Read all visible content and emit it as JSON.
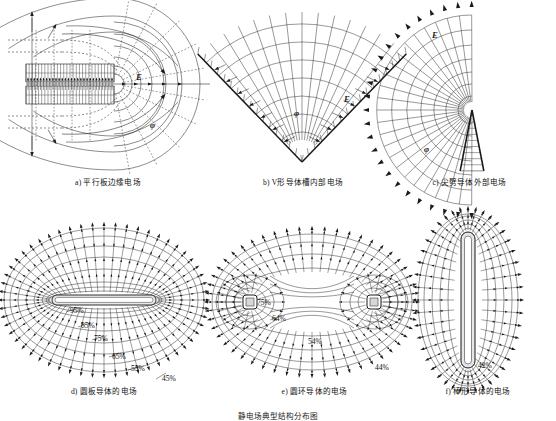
{
  "figure": {
    "title": "静电场典型结构分布图",
    "background": "#ffffff",
    "ink": "#1a1a1a",
    "panels": [
      {
        "id": "a",
        "caption": "a) 平行板边缘电场",
        "type": "parallel-plate-fringing",
        "labels": [
          {
            "text": "E",
            "x": 134,
            "y": 78,
            "kind": "field-strength"
          },
          {
            "text": "φ",
            "x": 146,
            "y": 122,
            "kind": "potential"
          }
        ],
        "geometry": {
          "plate_left": 24,
          "plate_right": 112,
          "plate_top": 60,
          "plate_bottom": 100,
          "axis_y": 80,
          "plate_rows": 2,
          "plate_hatch_count": 26,
          "equipotential_radii": [
            12,
            22,
            33,
            46,
            62,
            80
          ],
          "flux_angles": [
            0,
            20,
            40,
            60,
            80,
            100,
            120,
            140,
            160,
            180
          ]
        }
      },
      {
        "id": "b",
        "caption": "b) V形导体槽内部电场",
        "type": "v-groove-internal",
        "labels": [
          {
            "text": "E",
            "x": 118,
            "y": 92,
            "kind": "field-strength"
          },
          {
            "text": "φ",
            "x": 66,
            "y": 105,
            "kind": "potential"
          }
        ],
        "geometry": {
          "apex_x": 62,
          "apex_y": 158,
          "half_angle_deg": 42,
          "arc_radii": [
            28,
            45,
            62,
            79,
            96,
            113,
            130,
            147
          ],
          "ray_count": 13,
          "hatch_count": 12
        }
      },
      {
        "id": "c",
        "caption": "c) 尖劈导体外部电场",
        "type": "wedge-external",
        "labels": [
          {
            "text": "E",
            "x": 40,
            "y": 28,
            "kind": "field-strength"
          },
          {
            "text": "φ",
            "x": 36,
            "y": 140,
            "kind": "potential"
          }
        ],
        "geometry": {
          "apex_x": 78,
          "apex_y": 96,
          "wedge_half_angle_deg": 12,
          "arc_radii": [
            14,
            26,
            38,
            51,
            65,
            80,
            96
          ],
          "ray_count": 21,
          "arrow_ring_radius": 96
        }
      },
      {
        "id": "d",
        "caption": "d) 圆板导体的电场",
        "type": "disc-conductor",
        "labels": [
          {
            "text": "E",
            "x": 0,
            "y": 0,
            "kind": "none"
          }
        ],
        "percent_labels": [
          {
            "text": "95%",
            "x": 66,
            "y": 97
          },
          {
            "text": "85%",
            "x": 77,
            "y": 112
          },
          {
            "text": "75%",
            "x": 90,
            "y": 125
          },
          {
            "text": "65%",
            "x": 108,
            "y": 143
          },
          {
            "text": "55%",
            "x": 127,
            "y": 155
          },
          {
            "text": "45%",
            "x": 158,
            "y": 165
          }
        ],
        "geometry": {
          "cx": 102,
          "cy": 87,
          "plate_half_width": 52,
          "plate_half_height": 5,
          "shell_count": 7,
          "outer_rx": 95,
          "outer_ry": 72
        }
      },
      {
        "id": "e",
        "caption": "e) 圆环导体的电场",
        "type": "ring-conductor",
        "percent_labels": [
          {
            "text": "75%",
            "x": 45,
            "y": 87
          },
          {
            "text": "64%",
            "x": 60,
            "y": 103
          },
          {
            "text": "54%",
            "x": 96,
            "y": 126
          },
          {
            "text": "44%",
            "x": 163,
            "y": 152
          }
        ],
        "geometry": {
          "cx": 100,
          "cy": 86,
          "electrode_offset": 62,
          "electrode_r": 7,
          "shell_count": 6,
          "outer_rx": 98,
          "outer_ry": 68
        }
      },
      {
        "id": "f",
        "caption": "f) 棒形导体的电场",
        "type": "rod-conductor",
        "percent_labels": [
          {
            "text": "42%",
            "x": 66,
            "y": 152
          }
        ],
        "geometry": {
          "cx": 52,
          "cy": 85,
          "rod_half_height": 66,
          "rod_half_width": 5,
          "shell_count": 5,
          "outer_rx": 46,
          "outer_ry": 82
        }
      }
    ]
  }
}
